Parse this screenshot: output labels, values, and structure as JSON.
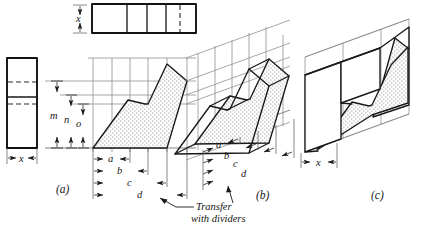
{
  "figure": {
    "background_color": "#ffffff",
    "ink_color": "#1a1a1a",
    "construction_color": "#8a8a8a",
    "stipple_color": "#5a5a5a"
  },
  "views": [
    {
      "key": "a",
      "label": "(a)",
      "caption_position": {
        "x": 56,
        "y": 193
      },
      "description": "orthographic views: top view, side view and front view with dimension transfer"
    },
    {
      "key": "b",
      "label": "(b)",
      "caption_position": {
        "x": 257,
        "y": 196
      },
      "description": "oblique construction with offset measurements laid out along receding axis"
    },
    {
      "key": "c",
      "label": "(c)",
      "caption_position": {
        "x": 372,
        "y": 196
      },
      "description": "completed oblique pictorial of the object"
    }
  ],
  "dimensions": {
    "front_view_horizontal": [
      {
        "id": "a",
        "label": "a",
        "text_x": 111,
        "text_y": 158,
        "line_y": 159,
        "x1": 93,
        "x2": 130
      },
      {
        "id": "b",
        "label": "b",
        "text_x": 120,
        "text_y": 170,
        "line_y": 171,
        "x1": 93,
        "x2": 148
      },
      {
        "id": "c",
        "label": "c",
        "text_x": 130,
        "text_y": 182,
        "line_y": 183,
        "x1": 93,
        "x2": 167
      },
      {
        "id": "d",
        "label": "d",
        "text_x": 140,
        "text_y": 194,
        "line_y": 195,
        "x1": 93,
        "x2": 187
      }
    ],
    "front_view_vertical": [
      {
        "id": "m",
        "label": "m",
        "text_x": 51,
        "text_y": 119,
        "line_x": 57,
        "y1": 81,
        "y2": 148
      },
      {
        "id": "n",
        "label": "n",
        "text_x": 65,
        "text_y": 123,
        "line_x": 71,
        "y1": 95,
        "y2": 148
      },
      {
        "id": "o",
        "label": "o",
        "text_x": 77,
        "text_y": 127,
        "line_x": 83,
        "y1": 104,
        "y2": 148
      }
    ],
    "top_view_depth": {
      "id": "x",
      "label": "x",
      "text_x": 76,
      "text_y": 22,
      "line_x": 80,
      "y1": 5,
      "y2": 33
    },
    "side_view_width": {
      "id": "x",
      "label": "x",
      "text_x": 20,
      "text_y": 162,
      "line_y": 158,
      "x1": 7,
      "x2": 37
    },
    "oblique_view_width": {
      "id": "x",
      "label": "x",
      "text_x": 318,
      "text_y": 166,
      "line_y": 162,
      "x1": 301,
      "x2": 337
    },
    "oblique_offsets": [
      {
        "id": "a",
        "label": "a",
        "text_x": 219,
        "text_y": 146
      },
      {
        "id": "b",
        "label": "b",
        "text_x": 226,
        "text_y": 157
      },
      {
        "id": "c",
        "label": "c",
        "text_x": 234,
        "text_y": 168
      },
      {
        "id": "d",
        "label": "d",
        "text_x": 242,
        "text_y": 179
      }
    ]
  },
  "annotations": [
    {
      "id": "transfer-note",
      "line1": "Transfer",
      "line2": "with dividers",
      "line1_x": 196,
      "line1_y": 207,
      "line2_x": 191,
      "line2_y": 219,
      "leader": {
        "x1": 160,
        "y1": 198,
        "x2": 176,
        "y2": 207,
        "x3": 192,
        "y3": 207
      }
    }
  ]
}
